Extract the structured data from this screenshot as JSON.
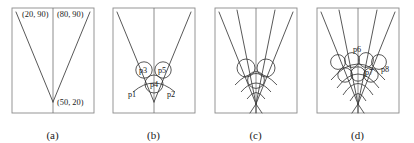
{
  "figure": {
    "background_color": "#ffffff",
    "frame_color": "#8a8a8a",
    "line_color": "#3a3a3a",
    "text_color": "#1a1a1a",
    "panel_count": 4
  },
  "panels": [
    {
      "id": "a",
      "caption": "(a)",
      "labels": {
        "top_left": "(20, 90)",
        "top_right": "(80, 90)",
        "apex": "(50, 20)"
      },
      "ray_count": 2,
      "circle_count": 0,
      "point_labels": []
    },
    {
      "id": "b",
      "caption": "(b)",
      "labels": {},
      "ray_count": 2,
      "circle_count": 3,
      "point_labels": [
        {
          "name": "p1",
          "x": 28,
          "y": 96
        },
        {
          "name": "p2",
          "x": 66,
          "y": 96
        },
        {
          "name": "p3",
          "x": 35,
          "y": 67
        },
        {
          "name": "p4",
          "x": 47,
          "y": 82
        },
        {
          "name": "p5",
          "x": 59,
          "y": 67
        }
      ]
    },
    {
      "id": "c",
      "caption": "(c)",
      "labels": {},
      "ray_count": 5,
      "circle_count": 5,
      "point_labels": []
    },
    {
      "id": "d",
      "caption": "(d)",
      "labels": {},
      "ray_count": 5,
      "circle_count": 11,
      "point_labels": [
        {
          "name": "p6",
          "x": 49,
          "y": 49
        },
        {
          "name": "p7",
          "x": 62,
          "y": 71
        },
        {
          "name": "p8",
          "x": 78,
          "y": 69
        }
      ]
    }
  ]
}
